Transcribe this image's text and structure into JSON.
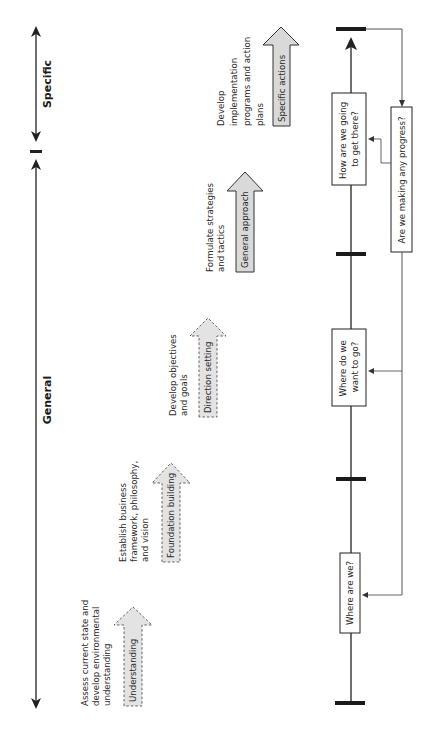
{
  "scope_axis": {
    "specific_label": "Specific",
    "general_label": "General"
  },
  "stages": [
    {
      "arrow_label": "Understanding",
      "description": [
        "Assess current state and",
        "develop environmental",
        "understanding"
      ],
      "style": "dashed"
    },
    {
      "arrow_label": "Foundation building",
      "description": [
        "Establish business",
        "framework, philosophy,",
        "and vision"
      ],
      "style": "dashed"
    },
    {
      "arrow_label": "Direction setting",
      "description": [
        "Develop objectives",
        "and goals"
      ],
      "style": "dashed"
    },
    {
      "arrow_label": "General approach",
      "description": [
        "Formulate strategies",
        "and tactics"
      ],
      "style": "solid"
    },
    {
      "arrow_label": "Specific actions",
      "description": [
        "Develop",
        "implementation",
        "programs and action",
        "plans"
      ],
      "style": "solid"
    }
  ],
  "timeline": {
    "questions": [
      {
        "line1": "Where are we?",
        "line2": ""
      },
      {
        "line1": "Where do we",
        "line2": "want to go?"
      },
      {
        "line1": "How are we going",
        "line2": "to get there?"
      }
    ],
    "feedback_label": "Are we making any progress?"
  },
  "colors": {
    "arrow_fill": "#d9d9d9",
    "line": "#222222",
    "bar": "#1a1a1a",
    "feedback_line": "#555555"
  }
}
